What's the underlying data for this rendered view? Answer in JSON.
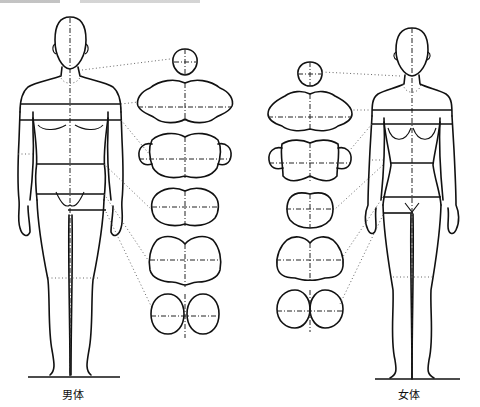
{
  "figure": {
    "type": "body cross-section comparison diagram",
    "figures": [
      {
        "id": "male",
        "label": "男体"
      },
      {
        "id": "female",
        "label": "女体"
      }
    ],
    "section_levels": [
      "head",
      "chest",
      "upper-arm/bust",
      "waist",
      "hip",
      "thigh"
    ],
    "colors": {
      "ink": "#111111",
      "background": "#ffffff"
    }
  }
}
